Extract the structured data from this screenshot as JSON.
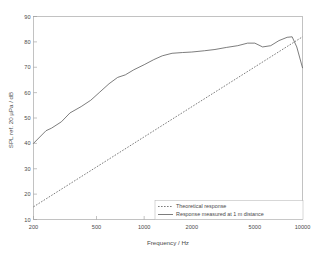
{
  "chart_data": {
    "type": "line",
    "title": "",
    "xlabel": "Frequency / Hz",
    "ylabel": "SPL ref. 20 µPa / dB",
    "xscale": "log",
    "xlim": [
      200,
      10000
    ],
    "ylim": [
      10,
      90
    ],
    "xticks": [
      200,
      500,
      1000,
      2000,
      5000,
      10000
    ],
    "xtick_labels": [
      "200",
      "500",
      "1000",
      "2000",
      "5000",
      "10000"
    ],
    "yticks": [
      10,
      20,
      30,
      40,
      50,
      60,
      70,
      80,
      90
    ],
    "ytick_labels": [
      "10",
      "20",
      "30",
      "40",
      "50",
      "60",
      "70",
      "80",
      "90"
    ],
    "grid": false,
    "legend_position": "lower right",
    "series": [
      {
        "name": "Theoretical response",
        "style": "dotted",
        "color": "#5c5c5c",
        "x": [
          200,
          10000
        ],
        "y": [
          15.0,
          82.0
        ]
      },
      {
        "name": "Response measured at 1 m distance",
        "style": "solid",
        "color": "#5c5c5c",
        "x": [
          200,
          240,
          260,
          300,
          340,
          400,
          460,
          520,
          600,
          680,
          760,
          860,
          1000,
          1150,
          1300,
          1500,
          1750,
          2000,
          2400,
          2800,
          3300,
          3900,
          4500,
          5000,
          5600,
          6300,
          7100,
          8000,
          8600,
          9200,
          10000
        ],
        "y": [
          40.0,
          45.0,
          46.0,
          48.5,
          52.0,
          54.5,
          57.0,
          60.0,
          63.5,
          66.0,
          67.0,
          69.0,
          71.0,
          73.0,
          74.5,
          75.5,
          75.8,
          76.0,
          76.5,
          77.0,
          77.8,
          78.5,
          79.5,
          79.5,
          78.0,
          78.5,
          80.5,
          81.8,
          82.0,
          78.0,
          69.8
        ]
      }
    ]
  },
  "legend": {
    "entries": [
      {
        "label": "Theoretical response",
        "marker": "dotted-line"
      },
      {
        "label": "Response measured at 1 m distance",
        "marker": "solid-line"
      }
    ]
  },
  "colors": {
    "background": "#ffffff",
    "axis": "#9a9a9a",
    "text": "#4a4a4a",
    "series": "#5c5c5c"
  }
}
